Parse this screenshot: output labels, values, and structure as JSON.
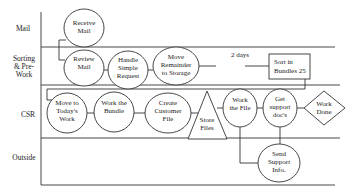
{
  "lanes": [
    {
      "id": "mail",
      "label_lines": [
        "Mail"
      ]
    },
    {
      "id": "sorting",
      "label_lines": [
        "Sorting",
        "& Pre-",
        "Work"
      ]
    },
    {
      "id": "csr",
      "label_lines": [
        "CSR"
      ]
    },
    {
      "id": "outside",
      "label_lines": [
        "Outside"
      ]
    }
  ],
  "nodes": [
    {
      "id": "receive-mail",
      "shape": "circle",
      "lane": "mail",
      "lines": [
        "Receive",
        "Mail"
      ]
    },
    {
      "id": "review-mail",
      "shape": "circle",
      "lane": "sorting",
      "lines": [
        "Review",
        "Mail"
      ]
    },
    {
      "id": "handle-simple-request",
      "shape": "circle",
      "lane": "sorting",
      "lines": [
        "Handle",
        "Simple",
        "Request"
      ]
    },
    {
      "id": "move-remainder-to-storage",
      "shape": "circle",
      "lane": "sorting",
      "lines": [
        "Move",
        "Remainder",
        "to Storage"
      ]
    },
    {
      "id": "sort-in-bundles",
      "shape": "rect",
      "lane": "sorting",
      "lines": [
        "Sort in",
        "Bundles 25"
      ]
    },
    {
      "id": "move-to-todays-work",
      "shape": "circle",
      "lane": "csr",
      "lines": [
        "Move to",
        "Today's",
        "Work"
      ]
    },
    {
      "id": "work-the-bundle",
      "shape": "circle",
      "lane": "csr",
      "lines": [
        "Work the",
        "Bundle"
      ]
    },
    {
      "id": "create-customer-file",
      "shape": "circle",
      "lane": "csr",
      "lines": [
        "Create",
        "Customer",
        "File"
      ]
    },
    {
      "id": "store-files",
      "shape": "triangle",
      "lane": "csr",
      "lines": [
        "Store",
        "Files"
      ]
    },
    {
      "id": "work-the-file",
      "shape": "circle",
      "lane": "csr",
      "lines": [
        "Work",
        "the File"
      ]
    },
    {
      "id": "get-support-docs",
      "shape": "circle",
      "lane": "csr",
      "lines": [
        "Get",
        "support",
        "doc's"
      ]
    },
    {
      "id": "work-done",
      "shape": "diamond",
      "lane": "csr",
      "lines": [
        "Work",
        "Done"
      ]
    },
    {
      "id": "send-support-info",
      "shape": "circle",
      "lane": "outside",
      "lines": [
        "Send",
        "Support",
        "Info."
      ]
    }
  ],
  "annotations": {
    "delay_label": "2 days"
  },
  "edges": [
    [
      "receive-mail",
      "review-mail"
    ],
    [
      "review-mail",
      "handle-simple-request"
    ],
    [
      "handle-simple-request",
      "move-remainder-to-storage"
    ],
    [
      "move-remainder-to-storage",
      "sort-in-bundles"
    ],
    [
      "sort-in-bundles",
      "move-to-todays-work"
    ],
    [
      "move-to-todays-work",
      "work-the-bundle"
    ],
    [
      "work-the-bundle",
      "create-customer-file"
    ],
    [
      "create-customer-file",
      "store-files"
    ],
    [
      "store-files",
      "work-the-file"
    ],
    [
      "work-the-file",
      "get-support-docs"
    ],
    [
      "get-support-docs",
      "work-done"
    ],
    [
      "work-the-file",
      "send-support-info"
    ],
    [
      "get-support-docs",
      "send-support-info"
    ]
  ]
}
